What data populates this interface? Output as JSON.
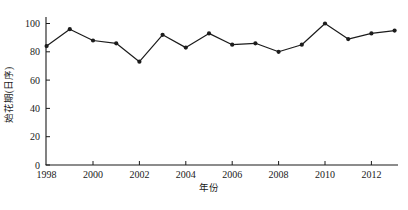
{
  "figure": {
    "background": "#ffffff",
    "axis_color": "#1a1a1a"
  },
  "chart_data": {
    "type": "line",
    "x": [
      1998,
      1999,
      2000,
      2001,
      2002,
      2003,
      2004,
      2005,
      2006,
      2007,
      2008,
      2009,
      2010,
      2011,
      2012,
      2013
    ],
    "series": [
      {
        "name": "first-flowering-date",
        "values": [
          84,
          96,
          88,
          86,
          73,
          92,
          83,
          93,
          85,
          86,
          80,
          85,
          100,
          89,
          93,
          95
        ],
        "color": "#1c1c1c",
        "marker": "dot"
      }
    ],
    "title": "",
    "xlabel": "年份",
    "ylabel": "始花期(日序)",
    "ylim": [
      0,
      100
    ],
    "yticks": [
      0,
      20,
      40,
      60,
      80,
      100
    ],
    "xticks": [
      1998,
      2000,
      2002,
      2004,
      2006,
      2008,
      2010,
      2012
    ],
    "grid": false,
    "legend_position": "none"
  }
}
